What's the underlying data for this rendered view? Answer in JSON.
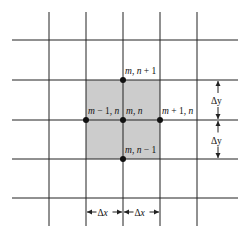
{
  "diagram": {
    "type": "finite-difference-grid",
    "grid": {
      "horizontal_lines_y": [
        40,
        80,
        120,
        159,
        198
      ],
      "vertical_lines_x": [
        49,
        86,
        123,
        160,
        197
      ],
      "h_extent": [
        12,
        238
      ],
      "v_extent": [
        12,
        226
      ],
      "line_color": "#222222"
    },
    "shaded_cell": {
      "x": 86,
      "y": 80,
      "w": 74,
      "h": 79,
      "color": "#cccccc"
    },
    "nodes": [
      {
        "id": "top",
        "x": 123,
        "y": 80,
        "label_pre": "m",
        "label_mid": ", ",
        "label_post": "n",
        "label_op": " + 1",
        "lx": 125,
        "ly": 74
      },
      {
        "id": "left",
        "x": 86,
        "y": 120,
        "label_pre": "m",
        "label_mid": " − 1, ",
        "label_post": "n",
        "label_op": "",
        "lx": 88,
        "ly": 114
      },
      {
        "id": "center",
        "x": 123,
        "y": 120,
        "label_pre": "m",
        "label_mid": ", ",
        "label_post": "n",
        "label_op": "",
        "lx": 126,
        "ly": 114
      },
      {
        "id": "right",
        "x": 160,
        "y": 120,
        "label_pre": "m",
        "label_mid": " + 1, ",
        "label_post": "n",
        "label_op": "",
        "lx": 162,
        "ly": 114
      },
      {
        "id": "bottom",
        "x": 123,
        "y": 159,
        "label_pre": "m",
        "label_mid": ", ",
        "label_post": "n",
        "label_op": " − 1",
        "lx": 125,
        "ly": 153
      }
    ],
    "dimensions": {
      "dy_label": "Δy",
      "dx_label": "Δx",
      "dy_arrow_x": 218,
      "dx_arrow_y": 212
    }
  }
}
